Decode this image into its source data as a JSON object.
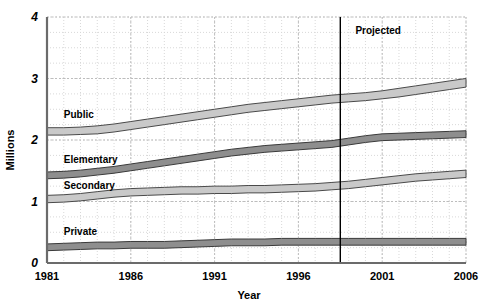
{
  "chart_data": {
    "type": "area",
    "title": "",
    "xlabel": "Year",
    "ylabel": "Millions",
    "xlim": [
      1981,
      2006
    ],
    "ylim": [
      0,
      4
    ],
    "grid": true,
    "legend_position": "inline-labels",
    "x_ticks": [
      "1981",
      "1986",
      "1991",
      "1996",
      "2001",
      "2006"
    ],
    "x_tick_values": [
      1981,
      1986,
      1991,
      1996,
      2001,
      2006
    ],
    "y_ticks": [
      "0",
      "1",
      "2",
      "3",
      "4"
    ],
    "y_tick_values": [
      0,
      1,
      2,
      3,
      4
    ],
    "annotations": [
      {
        "text": "Projected",
        "x": 1999.4,
        "y": 3.72
      },
      {
        "text": "divider-line",
        "x": 1998.5,
        "y0": 0,
        "y1": 4
      }
    ],
    "x": [
      1981,
      1982,
      1983,
      1984,
      1985,
      1986,
      1987,
      1988,
      1989,
      1990,
      1991,
      1992,
      1993,
      1994,
      1995,
      1996,
      1997,
      1998,
      1999,
      2000,
      2001,
      2002,
      2003,
      2004,
      2005,
      2006
    ],
    "bands": [
      {
        "name": "Public",
        "label": "Public",
        "label_x": 1982.0,
        "label_y": 2.36,
        "fill": "#c9c9c9",
        "stroke": "#4a4a4a",
        "lower": [
          2.08,
          2.08,
          2.09,
          2.1,
          2.13,
          2.17,
          2.21,
          2.25,
          2.29,
          2.33,
          2.37,
          2.41,
          2.45,
          2.48,
          2.51,
          2.54,
          2.57,
          2.6,
          2.62,
          2.64,
          2.67,
          2.7,
          2.74,
          2.78,
          2.82,
          2.86
        ],
        "upper": [
          2.2,
          2.2,
          2.21,
          2.23,
          2.26,
          2.3,
          2.34,
          2.38,
          2.42,
          2.46,
          2.5,
          2.54,
          2.58,
          2.61,
          2.64,
          2.67,
          2.7,
          2.73,
          2.75,
          2.77,
          2.8,
          2.84,
          2.88,
          2.92,
          2.96,
          3.0
        ]
      },
      {
        "name": "Elementary",
        "label": "Elementary",
        "label_x": 1982.0,
        "label_y": 1.62,
        "fill": "#8e8e8e",
        "stroke": "#3a3a3a",
        "lower": [
          1.37,
          1.38,
          1.4,
          1.43,
          1.46,
          1.5,
          1.54,
          1.58,
          1.62,
          1.66,
          1.7,
          1.74,
          1.77,
          1.8,
          1.82,
          1.84,
          1.86,
          1.88,
          1.92,
          1.96,
          1.99,
          2.0,
          2.01,
          2.02,
          2.03,
          2.04
        ],
        "upper": [
          1.48,
          1.49,
          1.51,
          1.54,
          1.57,
          1.61,
          1.65,
          1.69,
          1.73,
          1.77,
          1.81,
          1.85,
          1.88,
          1.91,
          1.93,
          1.95,
          1.97,
          1.99,
          2.03,
          2.07,
          2.1,
          2.11,
          2.12,
          2.13,
          2.14,
          2.15
        ]
      },
      {
        "name": "Secondary",
        "label": "Secondary",
        "label_x": 1982.0,
        "label_y": 1.21,
        "fill": "#c9c9c9",
        "stroke": "#4a4a4a",
        "lower": [
          0.98,
          0.99,
          1.01,
          1.04,
          1.07,
          1.09,
          1.1,
          1.11,
          1.12,
          1.12,
          1.13,
          1.13,
          1.14,
          1.14,
          1.15,
          1.16,
          1.17,
          1.19,
          1.21,
          1.24,
          1.27,
          1.3,
          1.33,
          1.35,
          1.37,
          1.39
        ],
        "upper": [
          1.1,
          1.11,
          1.13,
          1.16,
          1.19,
          1.21,
          1.22,
          1.23,
          1.24,
          1.24,
          1.25,
          1.25,
          1.26,
          1.26,
          1.27,
          1.28,
          1.29,
          1.31,
          1.33,
          1.36,
          1.39,
          1.42,
          1.45,
          1.47,
          1.49,
          1.51
        ]
      },
      {
        "name": "Private",
        "label": "Private",
        "label_x": 1982.0,
        "label_y": 0.45,
        "fill": "#8e8e8e",
        "stroke": "#3a3a3a",
        "lower": [
          0.2,
          0.21,
          0.22,
          0.23,
          0.23,
          0.24,
          0.24,
          0.24,
          0.25,
          0.26,
          0.27,
          0.28,
          0.28,
          0.28,
          0.29,
          0.29,
          0.29,
          0.29,
          0.29,
          0.29,
          0.29,
          0.29,
          0.29,
          0.29,
          0.29,
          0.29
        ],
        "upper": [
          0.31,
          0.32,
          0.33,
          0.34,
          0.34,
          0.35,
          0.35,
          0.35,
          0.36,
          0.37,
          0.38,
          0.39,
          0.39,
          0.39,
          0.4,
          0.4,
          0.4,
          0.4,
          0.4,
          0.4,
          0.4,
          0.4,
          0.4,
          0.4,
          0.4,
          0.4
        ]
      }
    ]
  },
  "colors": {
    "axis": "#6b6b6b",
    "grid_minor": "#d8d8d8",
    "grid_major": "#bdbdbd",
    "divider": "#000000",
    "band_light": "#c9c9c9",
    "band_dark": "#8e8e8e",
    "text": "#111111"
  }
}
